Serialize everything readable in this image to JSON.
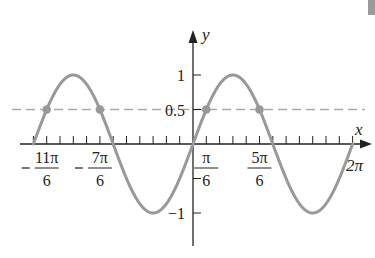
{
  "chart_data": {
    "type": "line",
    "title": "",
    "function": "y = sin x",
    "xlabel": "x",
    "ylabel": "y",
    "xlim": [
      -6.2832,
      6.2832
    ],
    "ylim": [
      -1.5,
      1.6
    ],
    "x_tick_step": "pi/6",
    "x_tick_labels": [
      {
        "value": -5.7596,
        "num": "11π",
        "den": "6",
        "sign": "−"
      },
      {
        "value": -3.6652,
        "num": "7π",
        "den": "6",
        "sign": "−"
      },
      {
        "value": 0.5236,
        "num": "π",
        "den": "6",
        "sign": ""
      },
      {
        "value": 2.618,
        "num": "5π",
        "den": "6",
        "sign": ""
      },
      {
        "value": 6.2832,
        "text": "2π"
      }
    ],
    "y_tick_labels": [
      {
        "value": 1,
        "text": "1"
      },
      {
        "value": 0.5,
        "text": "0.5"
      },
      {
        "value": -1,
        "text": "−1"
      }
    ],
    "y_ticks": [
      1,
      0.5,
      -0.5,
      -1
    ],
    "series": [
      {
        "name": "sin x",
        "color": "#999999",
        "x_range": [
          -6.2832,
          6.2832
        ]
      }
    ],
    "reference_lines": [
      {
        "name": "y = 0.5",
        "y": 0.5,
        "style": "dashed",
        "color": "#aaaaaa"
      }
    ],
    "points": [
      {
        "x": -5.7596,
        "y": 0.5,
        "label": "-11π/6"
      },
      {
        "x": -3.6652,
        "y": 0.5,
        "label": "-7π/6"
      },
      {
        "x": 0.5236,
        "y": 0.5,
        "label": "π/6"
      },
      {
        "x": 2.618,
        "y": 0.5,
        "label": "5π/6"
      }
    ],
    "grid": false,
    "legend": "none"
  },
  "colors": {
    "curve": "#999999",
    "dashed": "#aaaaaa",
    "points": "#999999",
    "axes": "#222222"
  }
}
